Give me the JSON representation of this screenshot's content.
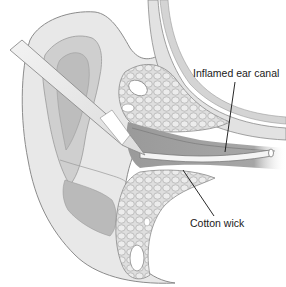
{
  "figure": {
    "labels": [
      {
        "id": "inflamed-ear-canal",
        "text": "Inflamed ear canal"
      },
      {
        "id": "cotton-wick",
        "text": "Cotton wick"
      }
    ],
    "colors": {
      "background": "#ffffff",
      "outline": "#8c8c8c",
      "light_fill": "#e6e6e6",
      "mid_fill": "#c9c9c9",
      "dark_fill": "#a8a8a8",
      "canal_fill": "#9e9e9e",
      "tissue_fill": "#dcdcdc",
      "leader_line": "#111111"
    }
  }
}
